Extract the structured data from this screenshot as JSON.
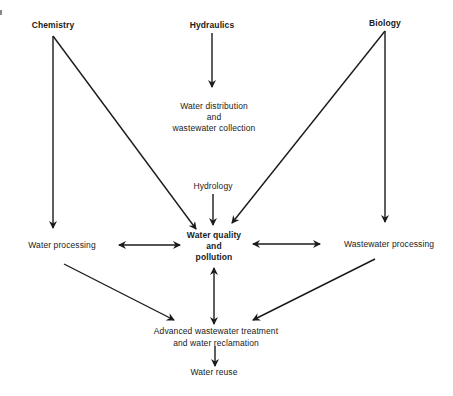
{
  "diagram": {
    "type": "flow-diagram",
    "stroke_color": "#1a1a1a",
    "background": "#ffffff",
    "nodes": {
      "chemistry": {
        "label": "Chemistry"
      },
      "hydraulics": {
        "label": "Hydraulics"
      },
      "biology": {
        "label": "Biology"
      },
      "water_distribution": {
        "lines": [
          "Water distribution",
          "and",
          "wastewater collection"
        ]
      },
      "hydrology": {
        "label": "Hydrology"
      },
      "water_quality": {
        "lines": [
          "Water quality",
          "and",
          "pollution"
        ]
      },
      "water_processing": {
        "label": "Water processing"
      },
      "wastewater_processing": {
        "label": "Wastewater processing"
      },
      "advanced_treatment": {
        "lines": [
          "Advanced wastewater treatment",
          "and water reclamation"
        ]
      },
      "water_reuse": {
        "label": "Water reuse"
      }
    },
    "edges": [
      {
        "from": "Hydraulics",
        "to": "Water distribution and wastewater collection",
        "type": "directed"
      },
      {
        "from": "Chemistry",
        "to": "Water processing",
        "type": "directed"
      },
      {
        "from": "Chemistry",
        "to": "Water quality and pollution",
        "type": "directed"
      },
      {
        "from": "Biology",
        "to": "Wastewater processing",
        "type": "directed"
      },
      {
        "from": "Biology",
        "to": "Water quality and pollution",
        "type": "directed"
      },
      {
        "from": "Hydrology",
        "to": "Water quality and pollution",
        "type": "directed"
      },
      {
        "from": "Water processing",
        "to": "Water quality and pollution",
        "type": "bidirectional"
      },
      {
        "from": "Wastewater processing",
        "to": "Water quality and pollution",
        "type": "bidirectional"
      },
      {
        "from": "Water quality and pollution",
        "to": "Advanced wastewater treatment and water reclamation",
        "type": "bidirectional"
      },
      {
        "from": "Water processing",
        "to": "Advanced wastewater treatment and water reclamation",
        "type": "directed"
      },
      {
        "from": "Wastewater processing",
        "to": "Advanced wastewater treatment and water reclamation",
        "type": "directed"
      },
      {
        "from": "Advanced wastewater treatment and water reclamation",
        "to": "Water reuse",
        "type": "directed"
      }
    ]
  }
}
